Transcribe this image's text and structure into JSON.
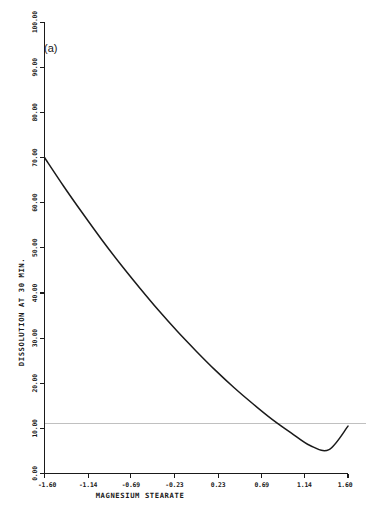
{
  "figure": {
    "panel_label": "(a)",
    "background_color": "#ffffff",
    "line_color": "#1a1a1a",
    "gridline_color": "#b9b9b9"
  },
  "chart_data": {
    "type": "line",
    "title": "",
    "subtitle": "",
    "panel": "(a)",
    "xlabel": "MAGNESIUM STEARATE",
    "ylabel": "DISSOLUTION AT 30 MIN.",
    "xlim": [
      -1.6,
      1.6
    ],
    "ylim": [
      0.0,
      100.0
    ],
    "grid": true,
    "gridlines_horizontal": [
      11.0
    ],
    "legend": [],
    "legend_position": "none",
    "xticks": [
      -1.6,
      -1.14,
      -0.69,
      -0.23,
      0.23,
      0.69,
      1.14,
      1.6
    ],
    "xtick_labels": [
      "-1.60",
      "-1.14",
      "-0.69",
      "-0.23",
      "0.23",
      "0.69",
      "1.14",
      "1.60"
    ],
    "yticks": [
      0.0,
      10.0,
      20.0,
      30.0,
      40.0,
      50.0,
      60.0,
      70.0,
      80.0,
      90.0,
      100.0
    ],
    "ytick_labels": [
      "0.00",
      "10.00",
      "20.00",
      "30.00",
      "40.00",
      "50.00",
      "60.00",
      "70.00",
      "80.00",
      "90.00",
      "100.00"
    ],
    "series": [
      {
        "name": "dissolution response",
        "x": [
          -1.6,
          -1.4,
          -1.2,
          -1.0,
          -0.8,
          -0.6,
          -0.4,
          -0.2,
          0.0,
          0.2,
          0.4,
          0.6,
          0.8,
          1.0,
          1.2,
          1.4,
          1.6
        ],
        "values": [
          70.0,
          63.7,
          57.7,
          51.9,
          46.4,
          41.2,
          36.2,
          31.5,
          27.1,
          22.9,
          19.0,
          15.4,
          12.0,
          9.0,
          6.2,
          5.3,
          10.5
        ]
      }
    ]
  }
}
